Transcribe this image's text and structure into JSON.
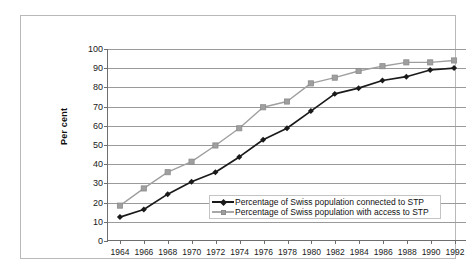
{
  "chart_data": {
    "type": "line",
    "title": "",
    "xlabel": "",
    "ylabel": "Per cent",
    "ylim": [
      0,
      100
    ],
    "ytick_values": [
      0,
      10,
      20,
      30,
      40,
      50,
      60,
      70,
      80,
      90,
      100
    ],
    "ytick_labels": [
      "0",
      "10",
      "20",
      "30",
      "40",
      "50",
      "60",
      "70",
      "80",
      "90",
      "100"
    ],
    "grid": "horizontal",
    "legend_position": "inside-lower-right",
    "x": [
      1964,
      1966,
      1968,
      1970,
      1972,
      1974,
      1976,
      1978,
      1980,
      1982,
      1984,
      1986,
      1988,
      1990,
      1992
    ],
    "categories": [
      "1964",
      "1966",
      "1968",
      "1970",
      "1972",
      "1974",
      "1976",
      "1978",
      "1980",
      "1982",
      "1984",
      "1986",
      "1988",
      "1990",
      "1992"
    ],
    "series": [
      {
        "name": "Percentage of Swiss population connected to STP",
        "color": "#1a1a1a",
        "marker": "diamond",
        "values": [
          12,
          16,
          24,
          30.5,
          35.5,
          43.5,
          52.5,
          58.5,
          67.5,
          76.5,
          79.5,
          83.5,
          85.5,
          89,
          90
        ]
      },
      {
        "name": "Percentage of Swiss population with access to STP",
        "color": "#9f9f9f",
        "marker": "square",
        "values": [
          18,
          27,
          35.5,
          41,
          49.5,
          58.5,
          69.5,
          72.5,
          82,
          85,
          88.5,
          91,
          93,
          93,
          94
        ]
      }
    ]
  },
  "legend": {
    "items": [
      {
        "label": "Percentage of Swiss population connected to STP"
      },
      {
        "label": "Percentage of Swiss population with access to STP"
      }
    ]
  },
  "axis": {
    "y_title": "Per cent"
  }
}
